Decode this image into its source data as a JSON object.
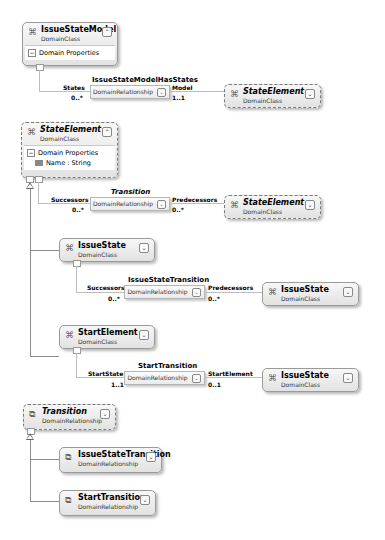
{
  "classes": {
    "issue_state_model": {
      "name": "IssueStateModel",
      "kind": "DomainClass",
      "section": "Domain Properties",
      "toggle": "⌃"
    },
    "state_element_main": {
      "name": "StateElement",
      "kind": "DomainClass",
      "section": "Domain Properties",
      "property": "Name : String",
      "toggle": "⌃"
    },
    "state_element_ref1": {
      "name": "StateElement",
      "kind": "DomainClass",
      "toggle": "⌄"
    },
    "state_element_ref2": {
      "name": "StateElement",
      "kind": "DomainClass",
      "toggle": "⌄"
    },
    "issue_state": {
      "name": "IssueState",
      "kind": "DomainClass",
      "toggle": "⌄"
    },
    "issue_state_ref1": {
      "name": "IssueState",
      "kind": "DomainClass",
      "toggle": "⌄"
    },
    "start_element": {
      "name": "StartElement",
      "kind": "DomainClass",
      "toggle": "⌄"
    },
    "issue_state_ref2": {
      "name": "IssueState",
      "kind": "DomainClass",
      "toggle": "⌄"
    },
    "transition": {
      "name": "Transition",
      "kind": "DomainRelationship",
      "toggle": "⌄"
    },
    "issue_state_transition": {
      "name": "IssueStateTransition",
      "kind": "DomainRelationship",
      "toggle": "⌄"
    },
    "start_transition": {
      "name": "StartTransition",
      "kind": "DomainRelationship",
      "toggle": "⌄"
    }
  },
  "relationships": {
    "has_states": {
      "name": "IssueStateModelHasStates",
      "kind": "DomainRelationship",
      "source_role": "States",
      "source_mult": "0..*",
      "target_role": "Model",
      "target_mult": "1..1",
      "toggle": "⌄"
    },
    "transition": {
      "name": "Transition",
      "kind": "DomainRelationship",
      "source_role": "Successors",
      "source_mult": "0..*",
      "target_role": "Predecessors",
      "target_mult": "0..*",
      "toggle": "⌄"
    },
    "issue_state_transition": {
      "name": "IssueStateTransition",
      "kind": "DomainRelationship",
      "source_role": "Successors",
      "source_mult": "0..*",
      "target_role": "Predecessors",
      "target_mult": "0..*",
      "toggle": "⌄"
    },
    "start_transition": {
      "name": "StartTransition",
      "kind": "DomainRelationship",
      "source_role": "StartState",
      "source_mult": "1..1",
      "target_role": "StartElement",
      "target_mult": "0..1",
      "toggle": "⌄"
    }
  },
  "glyphs": {
    "class_icon": "⌘",
    "rel_icon": "⧉",
    "minus": "−"
  }
}
